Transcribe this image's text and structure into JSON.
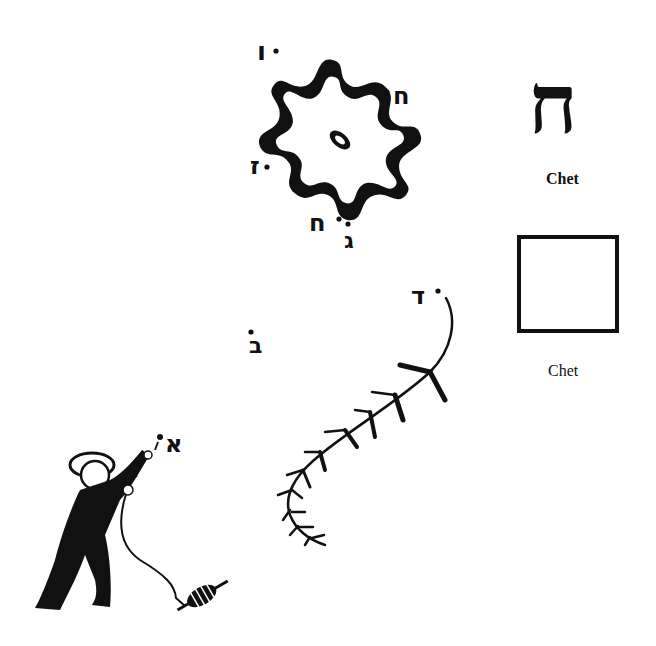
{
  "letter_panel": {
    "hebrew_letter": "ח",
    "name_bold": "Chet",
    "name_plain": "Chet"
  },
  "floating_letters": {
    "top_left": "ו",
    "right": "ח",
    "left": "ז",
    "bottom_chet": "ח",
    "bottom_gimel": "ג",
    "mid_bet": "ב",
    "vine_dalet": "ד",
    "kite_alef": "א"
  },
  "illustrations": {
    "blob": "flower-shaped black blob",
    "vine": "branching vine with leaves",
    "figure": "boy flying a kite holding string with spool"
  },
  "colors": {
    "ink": "#111111",
    "paper": "#ffffff"
  }
}
